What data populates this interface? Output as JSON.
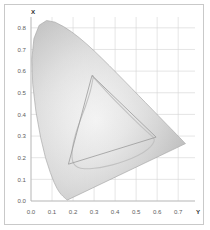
{
  "figure": {
    "name": "cie-chromaticity-diagram",
    "background": "#ffffff",
    "border_color": "#c9c9c9",
    "plot_background": "#ffffff",
    "grid_color": "#d3d3d3",
    "axis_color": "#b0b0b0"
  },
  "chart_data": {
    "type": "scatter",
    "title": "",
    "subtitle": "",
    "xlabel": "Y",
    "ylabel": "X",
    "xlim": [
      0.0,
      0.78
    ],
    "ylim": [
      0.0,
      0.85
    ],
    "grid": true,
    "legend": null,
    "xticks": [
      "0.0",
      "0.1",
      "0.2",
      "0.3",
      "0.4",
      "0.5",
      "0.6",
      "0.7"
    ],
    "xtick_values": [
      0.0,
      0.1,
      0.2,
      0.3,
      0.4,
      0.5,
      0.6,
      0.7
    ],
    "yticks": [
      "0.0",
      "0.1",
      "0.2",
      "0.3",
      "0.4",
      "0.5",
      "0.6",
      "0.7",
      "0.8"
    ],
    "ytick_values": [
      0.0,
      0.1,
      0.2,
      0.3,
      0.4,
      0.5,
      0.6,
      0.7,
      0.8
    ],
    "series": [
      {
        "name": "spectral-locus",
        "kind": "filled-region",
        "fill": "grayscale-gradient",
        "points": [
          [
            0.1741,
            0.005
          ],
          [
            0.174,
            0.005
          ],
          [
            0.1738,
            0.0049
          ],
          [
            0.1736,
            0.0049
          ],
          [
            0.1733,
            0.0048
          ],
          [
            0.173,
            0.0048
          ],
          [
            0.1726,
            0.0048
          ],
          [
            0.1721,
            0.0048
          ],
          [
            0.1714,
            0.0051
          ],
          [
            0.1703,
            0.0058
          ],
          [
            0.1689,
            0.0069
          ],
          [
            0.1669,
            0.0086
          ],
          [
            0.1644,
            0.0109
          ],
          [
            0.1611,
            0.0138
          ],
          [
            0.1566,
            0.0177
          ],
          [
            0.151,
            0.0227
          ],
          [
            0.144,
            0.0297
          ],
          [
            0.1355,
            0.0399
          ],
          [
            0.1241,
            0.0578
          ],
          [
            0.1096,
            0.0868
          ],
          [
            0.0913,
            0.1327
          ],
          [
            0.0687,
            0.2007
          ],
          [
            0.0454,
            0.295
          ],
          [
            0.0235,
            0.4127
          ],
          [
            0.0082,
            0.5384
          ],
          [
            0.0039,
            0.6548
          ],
          [
            0.0139,
            0.7502
          ],
          [
            0.0389,
            0.812
          ],
          [
            0.0743,
            0.8338
          ],
          [
            0.1142,
            0.8262
          ],
          [
            0.1547,
            0.8059
          ],
          [
            0.1929,
            0.7816
          ],
          [
            0.2296,
            0.7543
          ],
          [
            0.2658,
            0.7243
          ],
          [
            0.3016,
            0.6923
          ],
          [
            0.3373,
            0.6589
          ],
          [
            0.3731,
            0.6245
          ],
          [
            0.4087,
            0.5896
          ],
          [
            0.4441,
            0.5547
          ],
          [
            0.4788,
            0.5202
          ],
          [
            0.5125,
            0.4866
          ],
          [
            0.5448,
            0.4544
          ],
          [
            0.5752,
            0.4242
          ],
          [
            0.6029,
            0.3965
          ],
          [
            0.627,
            0.3725
          ],
          [
            0.6482,
            0.3514
          ],
          [
            0.6658,
            0.334
          ],
          [
            0.6801,
            0.3197
          ],
          [
            0.6915,
            0.3083
          ],
          [
            0.7006,
            0.2993
          ],
          [
            0.7079,
            0.292
          ],
          [
            0.714,
            0.2859
          ],
          [
            0.719,
            0.2809
          ],
          [
            0.723,
            0.277
          ],
          [
            0.726,
            0.274
          ],
          [
            0.7283,
            0.2717
          ],
          [
            0.73,
            0.27
          ],
          [
            0.7311,
            0.2689
          ],
          [
            0.732,
            0.268
          ],
          [
            0.7327,
            0.2673
          ],
          [
            0.7334,
            0.2666
          ],
          [
            0.734,
            0.266
          ],
          [
            0.7344,
            0.2656
          ],
          [
            0.7346,
            0.2654
          ],
          [
            0.7347,
            0.2653
          ]
        ]
      },
      {
        "name": "gamut-triangle",
        "kind": "polygon-outline",
        "stroke": "#9a9a9a",
        "vertices": [
          [
            0.29,
            0.58
          ],
          [
            0.595,
            0.295
          ],
          [
            0.178,
            0.17
          ]
        ],
        "vertex_labels": [
          "green-primary",
          "red-primary",
          "blue-primary"
        ]
      },
      {
        "name": "device-gamut-curve",
        "kind": "closed-curve",
        "stroke": "#c2c2c2",
        "points": [
          [
            0.296,
            0.572
          ],
          [
            0.356,
            0.509
          ],
          [
            0.418,
            0.446
          ],
          [
            0.476,
            0.39
          ],
          [
            0.524,
            0.345
          ],
          [
            0.56,
            0.313
          ],
          [
            0.582,
            0.293
          ],
          [
            0.586,
            0.278
          ],
          [
            0.57,
            0.252
          ],
          [
            0.534,
            0.224
          ],
          [
            0.48,
            0.198
          ],
          [
            0.418,
            0.176
          ],
          [
            0.356,
            0.16
          ],
          [
            0.3,
            0.151
          ],
          [
            0.254,
            0.149
          ],
          [
            0.222,
            0.156
          ],
          [
            0.202,
            0.174
          ],
          [
            0.195,
            0.204
          ],
          [
            0.198,
            0.25
          ],
          [
            0.212,
            0.308
          ],
          [
            0.234,
            0.372
          ],
          [
            0.26,
            0.44
          ],
          [
            0.283,
            0.511
          ],
          [
            0.296,
            0.572
          ]
        ]
      }
    ],
    "annotations": []
  },
  "axes": {
    "x_axis_label": "Y",
    "y_axis_label": "X"
  }
}
